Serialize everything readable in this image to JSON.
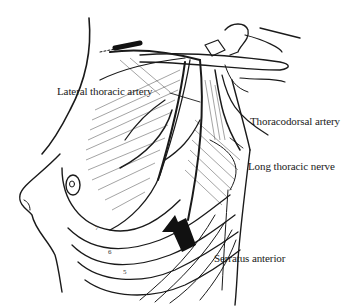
{
  "figure": {
    "labels": {
      "lateral_thoracic_artery": "Lateral thoracic artery",
      "thoracodorsal_artery": "Thoracodorsal artery",
      "long_thoracic_nerve": "Long thoracic nerve",
      "serratus_anterior": "Serratus anterior"
    },
    "rib_numbers": [
      "7",
      "6",
      "5"
    ],
    "colors": {
      "ink": "#1a1a1a",
      "background": "#ffffff"
    }
  }
}
